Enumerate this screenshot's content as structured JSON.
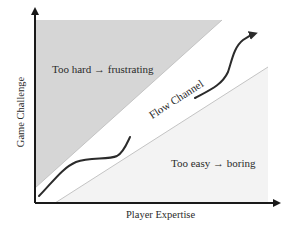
{
  "diagram": {
    "title": "Flow Channel",
    "axes": {
      "x_label": "Player Expertise",
      "y_label": "Game Challenge"
    },
    "regions": {
      "too_hard": {
        "label": "Too hard → frustrating",
        "fill": "#d6d6d6"
      },
      "flow": {
        "label": "Flow Channel",
        "fill": "#ffffff"
      },
      "too_easy": {
        "label": "Too easy → boring",
        "fill": "#f3f3f3"
      }
    },
    "colors": {
      "axis": "#1a1a1a",
      "boundary": "#bdbdbd",
      "path": "#2b2b2b",
      "text": "#2a2a2a"
    },
    "path": {
      "description": "Player progression curve through the flow channel",
      "has_arrowhead": true
    }
  }
}
